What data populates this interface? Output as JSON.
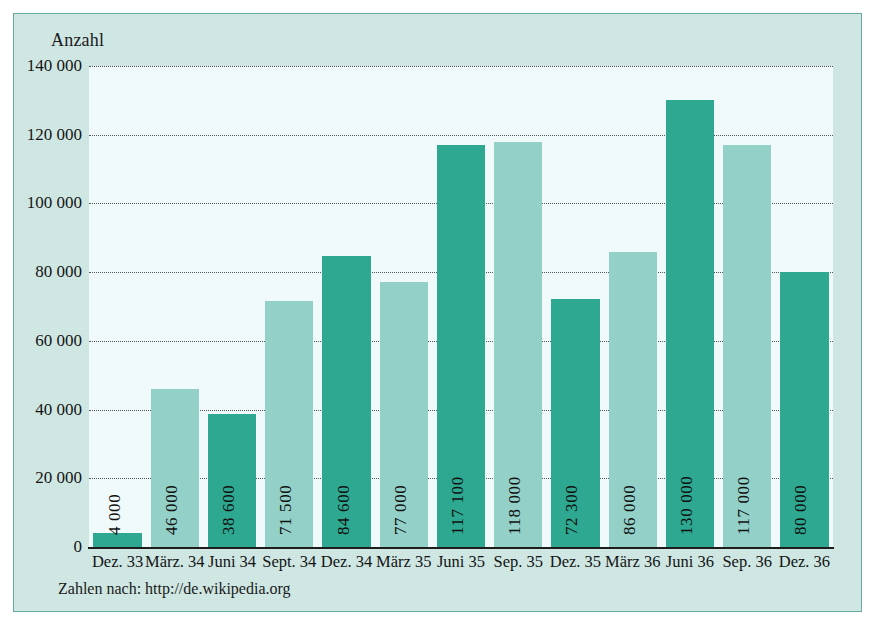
{
  "figure": {
    "axis_title": "Anzahl",
    "footnote": "Zahlen nach: http://de.wikipedia.org"
  },
  "colors": {
    "bar_dark": "#2ea890",
    "bar_light": "#92d0c8",
    "panel_background": "#cfe7e3",
    "plot_background": "#f1fafa",
    "panel_border": "#6aa9a2",
    "text": "#141414"
  },
  "chart_data": {
    "type": "bar",
    "title": "",
    "subtitle": "",
    "xlabel": "",
    "ylabel": "Anzahl",
    "ylim": [
      0,
      140000
    ],
    "ytick_values": [
      0,
      20000,
      40000,
      60000,
      80000,
      100000,
      120000,
      140000
    ],
    "ytick_labels": [
      "0",
      "20 000",
      "40 000",
      "60 000",
      "80 000",
      "100 000",
      "120 000",
      "140 000"
    ],
    "grid": true,
    "grid_style": "dotted-horizontal",
    "legend": null,
    "categories": [
      "Dez. 33",
      "März. 34",
      "Juni 34",
      "Sept. 34",
      "Dez. 34",
      "März 35",
      "Juni 35",
      "Sep. 35",
      "Dez. 35",
      "März 36",
      "Juni 36",
      "Sep. 36",
      "Dez. 36"
    ],
    "values": [
      4000,
      46000,
      38600,
      71500,
      84600,
      77000,
      117100,
      118000,
      72300,
      86000,
      130000,
      117000,
      80000
    ],
    "value_labels": [
      "4 000",
      "46 000",
      "38 600",
      "71 500",
      "84 600",
      "77 000",
      "117 100",
      "118 000",
      "72 300",
      "86 000",
      "130 000",
      "117 000",
      "80 000"
    ],
    "bar_colors": [
      "#2ea890",
      "#92d0c8",
      "#2ea890",
      "#92d0c8",
      "#2ea890",
      "#92d0c8",
      "#2ea890",
      "#92d0c8",
      "#2ea890",
      "#92d0c8",
      "#2ea890",
      "#92d0c8",
      "#2ea890"
    ],
    "annotations": [
      "Zahlen nach: http://de.wikipedia.org"
    ]
  }
}
